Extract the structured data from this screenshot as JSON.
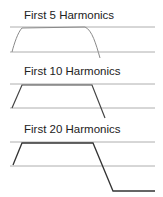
{
  "panels": [
    {
      "title": "First 5 Harmonics",
      "harmonics": 5,
      "upper_line_y": 27,
      "lower_line_y": 52,
      "curve": "M12,52 C14,44 18,32 22,28 L85,27 C92,30 96,44 100,58"
    },
    {
      "title": "First 10 Harmonics",
      "harmonics": 10,
      "upper_line_y": 84,
      "lower_line_y": 108,
      "curve": "M12,108 L22,85 L92,85 L105,118"
    },
    {
      "title": "First 20 Harmonics",
      "harmonics": 20,
      "upper_line_y": 142,
      "lower_line_y": 166,
      "curve": "M13,165 L22,143 L93,143 L113,191 L155,191"
    }
  ],
  "colors": {
    "axis_line": "#9a9a9a",
    "curve_5": "#8a8a8a",
    "curve_10": "#444444",
    "curve_20": "#333333"
  }
}
